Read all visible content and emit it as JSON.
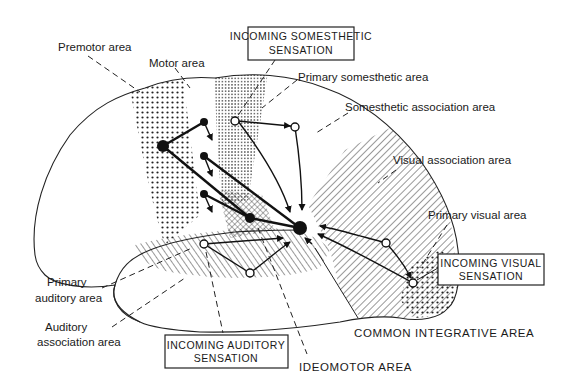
{
  "figure": {
    "colors": {
      "ink": "#1a1a1a",
      "background": "#ffffff"
    }
  },
  "labels": {
    "premotor_area": "Premotor area",
    "motor_area": "Motor area",
    "primary_somesthetic_area": "Primary somesthetic area",
    "somesthetic_association_area": "Somesthetic association area",
    "visual_association_area": "Visual association area",
    "primary_visual_area": "Primary visual area",
    "primary_auditory_area_line1": "Primary",
    "primary_auditory_area_line2": "auditory area",
    "auditory_association_area_line1": "Auditory",
    "auditory_association_area_line2": "association area",
    "common_integrative_area": "COMMON INTEGRATIVE AREA",
    "ideomotor_area": "IDEOMOTOR AREA"
  },
  "boxes": {
    "somesthetic": {
      "line1": "INCOMING SOMESTHETIC",
      "line2": "SENSATION"
    },
    "visual": {
      "line1": "INCOMING VISUAL",
      "line2": "SENSATION"
    },
    "auditory": {
      "line1": "INCOMING AUDITORY",
      "line2": "SENSATION"
    }
  },
  "legend_patterns": {
    "premotor": "coarse dots",
    "motor": "blank strip",
    "primary_somesthetic": "fine dots",
    "association_areas": "diagonal hatching",
    "ideomotor": "cross-hatching",
    "primary_visual": "coarse dots"
  }
}
